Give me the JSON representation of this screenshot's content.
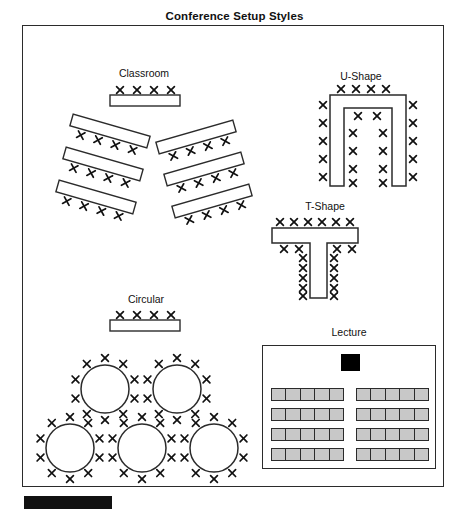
{
  "document": {
    "title": "Conference Setup Styles",
    "background_color": "#ffffff",
    "border_color": "#2b2b2b",
    "seat_marker": "X"
  },
  "sections": [
    {
      "id": "classroom",
      "label": "Classroom",
      "head_table_seats": 4,
      "rows_left": 3,
      "rows_right": 3,
      "seats_per_row": 4
    },
    {
      "id": "u-shape",
      "label": "U-Shape",
      "top_seats": 4,
      "outer_left_seats": 5,
      "outer_right_seats": 5,
      "inner_top_seats": 2,
      "inner_left_seats": 4,
      "inner_right_seats": 4
    },
    {
      "id": "t-shape",
      "label": "T-Shape",
      "top_seats": 6,
      "under_bar_left_seats": 2,
      "under_bar_right_seats": 2,
      "stem_left_seats": 5,
      "stem_right_seats": 5
    },
    {
      "id": "circular",
      "label": "Circular",
      "head_table_seats": 4,
      "round_tables": 5,
      "seats_per_round_table": 10,
      "table_rows": [
        2,
        3
      ]
    },
    {
      "id": "lecture",
      "label": "Lecture",
      "podium_color": "#000000",
      "seat_color": "#c8c8c8",
      "seat_block_rows": 4,
      "seat_block_columns": 2,
      "seats_per_block": 5
    }
  ],
  "lecture_blocks": [
    [
      1,
      2,
      3,
      4,
      5
    ],
    [
      1,
      2,
      3,
      4,
      5
    ],
    [
      1,
      2,
      3,
      4,
      5
    ],
    [
      1,
      2,
      3,
      4,
      5
    ],
    [
      1,
      2,
      3,
      4,
      5
    ],
    [
      1,
      2,
      3,
      4,
      5
    ],
    [
      1,
      2,
      3,
      4,
      5
    ],
    [
      1,
      2,
      3,
      4,
      5
    ]
  ]
}
